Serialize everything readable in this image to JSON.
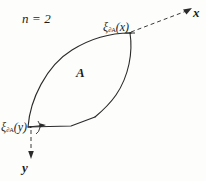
{
  "figure": {
    "title": "n = 2",
    "n_label": {
      "var": "n",
      "eq": " = ",
      "value": "2",
      "full": "n = 2"
    },
    "region_label": "A",
    "axes": [
      {
        "name": "x-axis",
        "label": "x",
        "style": "dashed",
        "arrow": "upper-right"
      },
      {
        "name": "y-axis",
        "label": "y",
        "style": "dashed",
        "arrow": "down"
      }
    ],
    "support_points": [
      {
        "name": "xi-boundary-x",
        "symbol": "ξ",
        "subscript": "∂A",
        "argument": "(x)",
        "full": "ξ∂A(x)",
        "position": "top-right-vertex"
      },
      {
        "name": "xi-boundary-y",
        "symbol": "ξ",
        "subscript": "∂A",
        "argument": "(y)",
        "full": "ξ∂A(y)",
        "position": "bottom-left-vertex"
      }
    ],
    "colors": {
      "ink": "#1c1c1c",
      "stroke": "#2a2a2a",
      "background": "#fdfdfc"
    }
  }
}
